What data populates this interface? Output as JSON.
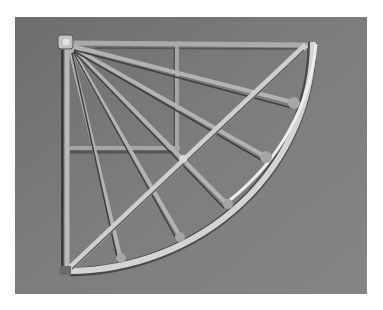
{
  "image": {
    "subject": "Quadrant frame instrument photograph",
    "style": "grayscale photo",
    "colors": {
      "page_background": "#ffffff",
      "photo_background": "#7b7b7b",
      "bar_light": "#c9c9c9",
      "bar_mid": "#a8a8a8",
      "bar_shadow": "#4a4a4a",
      "arc_highlight": "#e6e6e6"
    }
  }
}
